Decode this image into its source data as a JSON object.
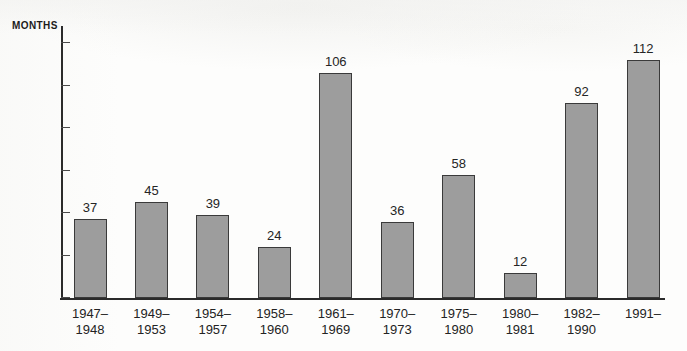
{
  "chart_data": {
    "type": "bar",
    "title": "",
    "subtitle": "",
    "xlabel": "",
    "ylabel": "MONTHS",
    "ylim": [
      0,
      128
    ],
    "yticks": [
      0,
      20,
      40,
      60,
      80,
      100,
      120
    ],
    "grid": false,
    "legend": null,
    "bar_color": "#9d9d9d",
    "bar_edge_color": "#3a3a3a",
    "axis_color": "#2b2b2b",
    "categories": [
      "1947–1948",
      "1949–1953",
      "1954–1957",
      "1958–1960",
      "1961–1969",
      "1970–1973",
      "1975–1980",
      "1980–1981",
      "1982–1990",
      "1991–"
    ],
    "category_lines": [
      [
        "1947–",
        "1948"
      ],
      [
        "1949–",
        "1953"
      ],
      [
        "1954–",
        "1957"
      ],
      [
        "1958–",
        "1960"
      ],
      [
        "1961–",
        "1969"
      ],
      [
        "1970–",
        "1973"
      ],
      [
        "1975–",
        "1980"
      ],
      [
        "1980–",
        "1981"
      ],
      [
        "1982–",
        "1990"
      ],
      [
        "1991–",
        ""
      ]
    ],
    "values": [
      37,
      45,
      39,
      24,
      106,
      36,
      58,
      12,
      92,
      112
    ],
    "value_labels": [
      "37",
      "45",
      "39",
      "24",
      "106",
      "36",
      "58",
      "12",
      "92",
      "112"
    ]
  }
}
